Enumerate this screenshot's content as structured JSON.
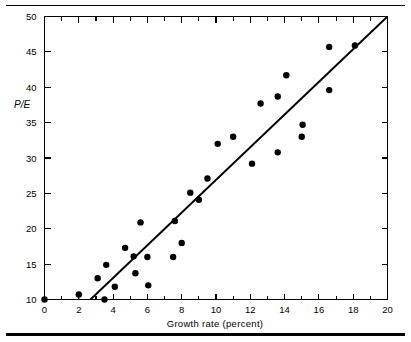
{
  "figure": {
    "background_color": "#ffffff",
    "ink_color": "#000000",
    "top_rule": "horizontal-rule",
    "bottom_rule": "horizontal-rule-thick"
  },
  "chart_data": {
    "type": "scatter",
    "title": "",
    "subtitle": "",
    "xlabel": "Growth rate (percent)",
    "ylabel": "P/E",
    "xlim": [
      0,
      20
    ],
    "ylim": [
      10,
      50
    ],
    "xticks": [
      0,
      2,
      4,
      6,
      8,
      10,
      12,
      14,
      16,
      18,
      20
    ],
    "xtick_labels": [
      "0",
      "2",
      "4",
      "6",
      "8",
      "10",
      "12",
      "14",
      "16",
      "18",
      "20"
    ],
    "x_minor_ticks": [
      1,
      3,
      5,
      7,
      9,
      11,
      13,
      15,
      17,
      19
    ],
    "yticks": [
      10,
      15,
      20,
      25,
      30,
      35,
      40,
      45,
      50
    ],
    "ytick_labels": [
      "10",
      "15",
      "20",
      "25",
      "30",
      "35",
      "40",
      "45",
      "50"
    ],
    "grid": false,
    "legend": null,
    "legend_position": "none",
    "marker": "filled-circle",
    "marker_size_px": 3.2,
    "series": [
      {
        "name": "companies",
        "points": [
          [
            0.0,
            10.0
          ],
          [
            2.0,
            10.7
          ],
          [
            3.1,
            13.0
          ],
          [
            3.5,
            10.0
          ],
          [
            3.6,
            14.9
          ],
          [
            4.1,
            11.8
          ],
          [
            4.7,
            17.3
          ],
          [
            5.2,
            16.1
          ],
          [
            5.3,
            13.7
          ],
          [
            5.6,
            20.9
          ],
          [
            6.0,
            16.0
          ],
          [
            6.05,
            12.0
          ],
          [
            7.5,
            16.0
          ],
          [
            7.6,
            21.1
          ],
          [
            8.0,
            18.0
          ],
          [
            8.5,
            25.1
          ],
          [
            9.0,
            24.1
          ],
          [
            9.5,
            27.1
          ],
          [
            10.1,
            32.0
          ],
          [
            11.0,
            33.0
          ],
          [
            12.1,
            29.2
          ],
          [
            12.6,
            37.7
          ],
          [
            13.6,
            30.8
          ],
          [
            13.6,
            38.7
          ],
          [
            14.1,
            41.7
          ],
          [
            15.0,
            33.0
          ],
          [
            15.05,
            34.7
          ],
          [
            16.6,
            39.6
          ],
          [
            16.6,
            45.7
          ],
          [
            18.1,
            45.9
          ]
        ]
      }
    ],
    "fit_line": {
      "name": "regression-line",
      "x_start": 2.68,
      "y_start": 10.0,
      "x_end": 20.0,
      "y_end": 50.0
    },
    "annotations": [
      {
        "name": "stem-at-x2",
        "type": "vertical-stem",
        "x": 2.0,
        "y_top": 10.7,
        "y_bottom": 10.0
      }
    ]
  }
}
